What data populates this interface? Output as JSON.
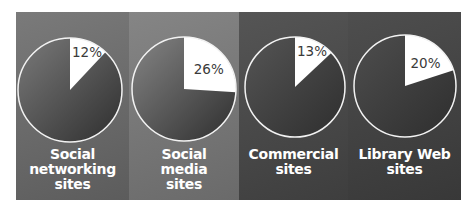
{
  "chart_data": {
    "type": "pie",
    "title": "",
    "layout": "four small-multiple pie charts side by side",
    "charts": [
      {
        "label": "Social networking sites",
        "value_pct": 12,
        "remainder_pct": 88
      },
      {
        "label": "Social media sites",
        "value_pct": 26,
        "remainder_pct": 74
      },
      {
        "label": "Commercial sites",
        "value_pct": 13,
        "remainder_pct": 87
      },
      {
        "label": "Library Web sites",
        "value_pct": 20,
        "remainder_pct": 80
      }
    ]
  },
  "panels": [
    {
      "label": "Social\nnetworking\nsites",
      "pct_text": "12%",
      "value": 12,
      "bg_top": "#7a7a7a",
      "bg_bottom": "#5c5c5c",
      "width": 113,
      "cx": 54,
      "cy": 78,
      "r": 52,
      "label_top": 135
    },
    {
      "label": "Social\nmedia\nsites",
      "pct_text": "26%",
      "value": 26,
      "bg_top": "#858585",
      "bg_bottom": "#6a6a6a",
      "width": 110,
      "cx": 55,
      "cy": 77,
      "r": 52,
      "label_top": 135
    },
    {
      "label": "Commercial\nsites",
      "pct_text": "13%",
      "value": 13,
      "bg_top": "#555555",
      "bg_bottom": "#3e3e3e",
      "width": 109,
      "cx": 56,
      "cy": 75,
      "r": 50,
      "label_top": 135
    },
    {
      "label": "Library Web\nsites",
      "pct_text": "20%",
      "value": 20,
      "bg_top": "#4e4e4e",
      "bg_bottom": "#383838",
      "width": 113,
      "cx": 57,
      "cy": 74,
      "r": 51,
      "label_top": 135
    }
  ],
  "colors": {
    "slice_highlight": "#ffffff",
    "pie_outline": "#f2f2f2",
    "label_text": "#ffffff",
    "pct_text": "#3a3a3a"
  }
}
